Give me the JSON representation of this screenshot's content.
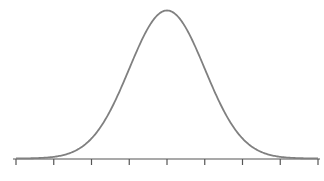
{
  "chart_data": {
    "type": "line",
    "title": "",
    "xlabel": "",
    "ylabel": "",
    "mean": 0,
    "sd": 1,
    "xlim": [
      -4,
      4
    ],
    "x_ticks": [
      -4,
      -3,
      -2,
      -1,
      0,
      1,
      2,
      3,
      4
    ],
    "x_tick_labels": [],
    "grid": false,
    "legend": null,
    "series": [
      {
        "name": "normal-pdf",
        "color": "#808080"
      }
    ]
  },
  "colors": {
    "curve": "#808080",
    "axis": "#555555"
  }
}
